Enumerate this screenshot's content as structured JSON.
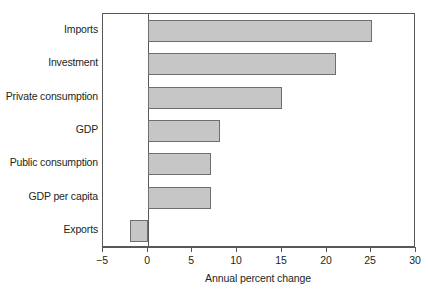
{
  "chart_data": {
    "type": "bar",
    "orientation": "horizontal",
    "title": "",
    "subtitle": "",
    "xlabel": "Annual percent change",
    "ylabel": "",
    "xlim": [
      -5,
      30
    ],
    "xticks": [
      "−5",
      "0",
      "5",
      "10",
      "15",
      "20",
      "25",
      "30"
    ],
    "xtick_values": [
      -5,
      0,
      5,
      10,
      15,
      20,
      25,
      30
    ],
    "grid": false,
    "legend": false,
    "categories": [
      "Imports",
      "Investment",
      "Private consumption",
      "GDP",
      "Public consumption",
      "GDP per capita",
      "Exports"
    ],
    "values": [
      25,
      21,
      15,
      8,
      7,
      7,
      -2
    ],
    "bar_fill_color": "#c6c6c6",
    "bar_edge_color": "#6d6e70",
    "axis_color": "#58585a",
    "text_color": "#231f20",
    "background_color": "#ffffff"
  }
}
